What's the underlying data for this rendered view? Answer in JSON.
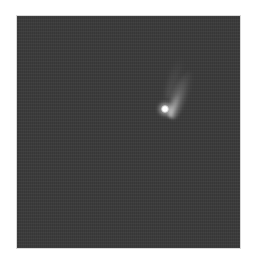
{
  "image": {
    "subject": "comet",
    "description": "Comet with bright nucleus and faint tail against dark night sky",
    "colors": {
      "sky": "#3a3a3a",
      "nucleus": "#ffffff",
      "tail": "#b4b4b4",
      "border": "#ffffff"
    }
  }
}
